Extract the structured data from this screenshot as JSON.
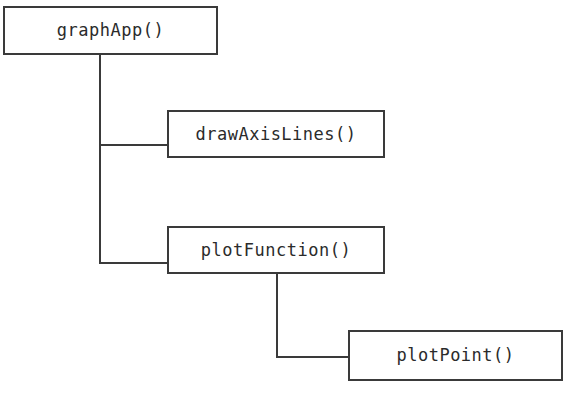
{
  "diagram": {
    "type": "call-hierarchy-tree",
    "title": "",
    "background_color": "#ffffff",
    "line_color": "#3a3a3a",
    "text_color": "#2b2b2b",
    "nodes": [
      {
        "id": "graphApp",
        "label": "graphApp()",
        "x": 3,
        "y": 6,
        "width": 215,
        "height": 49,
        "level": 0
      },
      {
        "id": "drawAxisLines",
        "label": "drawAxisLines()",
        "x": 167,
        "y": 110,
        "width": 218,
        "height": 48,
        "level": 1
      },
      {
        "id": "plotFunction",
        "label": "plotFunction()",
        "x": 167,
        "y": 226,
        "width": 218,
        "height": 48,
        "level": 1
      },
      {
        "id": "plotPoint",
        "label": "plotPoint()",
        "x": 348,
        "y": 330,
        "width": 215,
        "height": 51,
        "level": 2
      }
    ],
    "edges": [
      {
        "from": "graphApp",
        "to": "drawAxisLines"
      },
      {
        "from": "graphApp",
        "to": "plotFunction"
      },
      {
        "from": "plotFunction",
        "to": "plotPoint"
      }
    ]
  }
}
